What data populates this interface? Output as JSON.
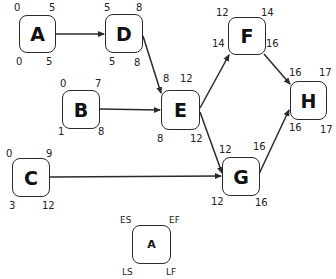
{
  "diagram": {
    "type": "activity-on-node network (critical path method)",
    "nodes": {
      "A": {
        "label": "A",
        "es": "0",
        "ef": "5",
        "ls": "0",
        "lf": "5"
      },
      "B": {
        "label": "B",
        "es": "0",
        "ef": "7",
        "ls": "1",
        "lf": "8"
      },
      "C": {
        "label": "C",
        "es": "0",
        "ef": "9",
        "ls": "3",
        "lf": "12"
      },
      "D": {
        "label": "D",
        "es": "5",
        "ef": "8",
        "ls": "5",
        "lf": "8"
      },
      "E": {
        "label": "E",
        "es": "8",
        "ef": "12",
        "ls": "8",
        "lf": "12"
      },
      "F": {
        "label": "F",
        "es": "12",
        "ef": "14",
        "ls": "14",
        "lf": "16"
      },
      "G": {
        "label": "G",
        "es": "12",
        "ef": "16",
        "ls": "12",
        "lf": "16"
      },
      "H": {
        "label": "H",
        "es": "16",
        "ef": "17",
        "ls": "16",
        "lf": "17"
      }
    },
    "edges": [
      {
        "from": "A",
        "to": "D"
      },
      {
        "from": "D",
        "to": "E"
      },
      {
        "from": "B",
        "to": "E"
      },
      {
        "from": "E",
        "to": "F"
      },
      {
        "from": "E",
        "to": "G"
      },
      {
        "from": "C",
        "to": "G"
      },
      {
        "from": "F",
        "to": "H"
      },
      {
        "from": "G",
        "to": "H"
      }
    ],
    "legend": {
      "label": "A",
      "es": "ES",
      "ef": "EF",
      "ls": "LS",
      "lf": "LF"
    }
  }
}
